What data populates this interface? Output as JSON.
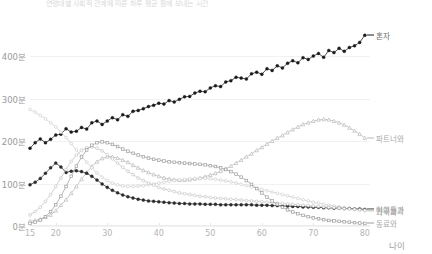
{
  "chart_title": "연령대별 사회적 관계에 따른 하루 평균 함께 보내는 시간",
  "axis": {
    "y_ticks": [
      "0분",
      "100분",
      "200분",
      "300분",
      "400분"
    ],
    "y_values": [
      0,
      100,
      200,
      300,
      400
    ],
    "x_ticks": [
      "15",
      "20",
      "30",
      "40",
      "50",
      "60",
      "70",
      "80"
    ],
    "x_values": [
      15,
      20,
      30,
      40,
      50,
      60,
      70,
      80
    ],
    "x_title": "나이",
    "y_title": ""
  },
  "colors": {
    "alone": "#1a1a1a",
    "partner": "#b9b9b9",
    "family": "#cfcfcf",
    "children": "#2b2b2b",
    "friends": "#c4c4c4",
    "coworkers": "#9e9e9e",
    "grid": "#f1f1f1",
    "text": "#8a8a8a",
    "background": "#ffffff"
  },
  "chart_data": {
    "type": "line",
    "title": "연령대별 사회적 관계에 따른 하루 평균 함께 보내는 시간",
    "xlabel": "나이",
    "ylabel": "분",
    "xlim": [
      15,
      81
    ],
    "ylim": [
      0,
      480
    ],
    "grid": true,
    "legend_position": "right-inline",
    "x": [
      15,
      16,
      17,
      18,
      19,
      20,
      21,
      22,
      23,
      24,
      25,
      26,
      27,
      28,
      29,
      30,
      31,
      32,
      33,
      34,
      35,
      36,
      37,
      38,
      39,
      40,
      41,
      42,
      43,
      44,
      45,
      46,
      47,
      48,
      49,
      50,
      51,
      52,
      53,
      54,
      55,
      56,
      57,
      58,
      59,
      60,
      61,
      62,
      63,
      64,
      65,
      66,
      67,
      68,
      69,
      70,
      71,
      72,
      73,
      74,
      75,
      76,
      77,
      78,
      79,
      80
    ],
    "series": [
      {
        "name": "혼자",
        "label": "혼자",
        "marker": "filled-circle",
        "color": "#1a1a1a",
        "values": [
          183,
          196,
          205,
          196,
          204,
          214,
          216,
          229,
          221,
          223,
          232,
          228,
          243,
          247,
          239,
          247,
          255,
          250,
          262,
          258,
          270,
          272,
          276,
          281,
          284,
          289,
          287,
          295,
          292,
          298,
          304,
          305,
          313,
          317,
          316,
          325,
          330,
          328,
          339,
          342,
          350,
          348,
          346,
          358,
          362,
          357,
          370,
          366,
          377,
          372,
          383,
          389,
          384,
          396,
          392,
          400,
          406,
          397,
          413,
          408,
          418,
          411,
          420,
          424,
          432,
          449
        ]
      },
      {
        "name": "파트너와",
        "label": "파트너와",
        "marker": "open-triangle",
        "color": "#b9b9b9",
        "values": [
          11,
          13,
          16,
          21,
          26,
          36,
          49,
          62,
          77,
          93,
          110,
          126,
          140,
          151,
          159,
          163,
          163,
          160,
          155,
          150,
          143,
          137,
          131,
          126,
          121,
          117,
          113,
          111,
          109,
          108,
          108,
          109,
          111,
          113,
          116,
          120,
          124,
          129,
          135,
          141,
          148,
          155,
          163,
          170,
          178,
          185,
          193,
          200,
          207,
          213,
          220,
          227,
          233,
          239,
          243,
          247,
          250,
          251,
          250,
          247,
          243,
          238,
          231,
          224,
          216,
          207
        ]
      },
      {
        "name": "가족과",
        "label": "가족과",
        "marker": "open-circle",
        "color": "#cfcfcf",
        "values": [
          274,
          268,
          260,
          252,
          243,
          233,
          221,
          208,
          194,
          179,
          164,
          150,
          137,
          125,
          115,
          107,
          101,
          97,
          94,
          93,
          93,
          94,
          95,
          97,
          99,
          101,
          103,
          105,
          107,
          109,
          110,
          111,
          112,
          112,
          112,
          111,
          110,
          108,
          106,
          104,
          101,
          98,
          95,
          92,
          89,
          86,
          83,
          80,
          77,
          74,
          71,
          68,
          65,
          62,
          59,
          56,
          54,
          51,
          49,
          47,
          45,
          43,
          41,
          39,
          38,
          36
        ]
      },
      {
        "name": "아이들과",
        "label": "아이들과",
        "marker": "filled-circle",
        "color": "#2b2b2b",
        "values": [
          97,
          103,
          112,
          124,
          137,
          148,
          139,
          126,
          129,
          130,
          128,
          124,
          117,
          108,
          99,
          91,
          84,
          78,
          73,
          69,
          66,
          63,
          61,
          59,
          58,
          57,
          56,
          55,
          54,
          53,
          53,
          52,
          52,
          52,
          51,
          51,
          51,
          50,
          50,
          50,
          50,
          50,
          50,
          50,
          49,
          49,
          49,
          48,
          48,
          47,
          47,
          46,
          46,
          45,
          45,
          44,
          44,
          43,
          43,
          42,
          42,
          41,
          41,
          40,
          40,
          39
        ]
      },
      {
        "name": "친구들과",
        "label": "친구들과",
        "marker": "open-circle",
        "color": "#c4c4c4",
        "values": [
          26,
          34,
          44,
          58,
          74,
          93,
          113,
          133,
          152,
          167,
          178,
          184,
          186,
          183,
          177,
          168,
          158,
          148,
          138,
          129,
          121,
          113,
          107,
          101,
          96,
          91,
          87,
          84,
          81,
          78,
          76,
          74,
          72,
          70,
          69,
          67,
          66,
          65,
          64,
          63,
          62,
          61,
          60,
          59,
          58,
          57,
          56,
          55,
          54,
          53,
          52,
          51,
          50,
          49,
          48,
          47,
          46,
          45,
          44,
          43,
          42,
          41,
          40,
          39,
          38,
          37
        ]
      },
      {
        "name": "동료와",
        "label": "동료와",
        "marker": "open-square",
        "color": "#9e9e9e",
        "values": [
          6,
          9,
          14,
          22,
          34,
          50,
          70,
          93,
          117,
          141,
          162,
          179,
          190,
          196,
          198,
          196,
          192,
          187,
          181,
          176,
          171,
          167,
          163,
          160,
          157,
          155,
          153,
          151,
          150,
          149,
          148,
          147,
          146,
          145,
          144,
          142,
          140,
          137,
          133,
          128,
          122,
          115,
          107,
          98,
          88,
          78,
          68,
          59,
          51,
          44,
          38,
          33,
          29,
          25,
          22,
          19,
          17,
          15,
          13,
          12,
          11,
          10,
          9,
          8,
          7,
          6
        ]
      }
    ]
  },
  "legend": [
    {
      "label": "혼자",
      "y_ratio": 0.05
    },
    {
      "label": "파트너와",
      "y_ratio": 0.478
    },
    {
      "label": "가족과",
      "y_ratio": 0.735
    },
    {
      "label": "아이들과",
      "y_ratio": 0.792
    },
    {
      "label": "친구들과",
      "y_ratio": 0.848
    },
    {
      "label": "동료와",
      "y_ratio": 0.905
    }
  ]
}
